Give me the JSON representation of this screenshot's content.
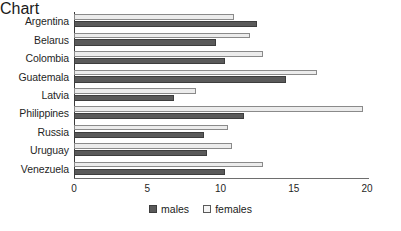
{
  "chart_data": {
    "type": "bar",
    "orientation": "horizontal",
    "title": "",
    "subtitle": "",
    "xlabel": "",
    "ylabel": "",
    "xlim": [
      0,
      20
    ],
    "xticks": [
      "0",
      "5",
      "10",
      "15",
      "20"
    ],
    "xtick_values": [
      0,
      5,
      10,
      15,
      20
    ],
    "grid": false,
    "legend_position": "bottom-center",
    "categories": [
      "Argentina",
      "Belarus",
      "Colombia",
      "Guatemala",
      "Latvia",
      "Philippines",
      "Russia",
      "Uruguay",
      "Venezuela"
    ],
    "series": [
      {
        "name": "males",
        "color": "#5a5a5a",
        "values": [
          12.5,
          9.7,
          10.3,
          14.5,
          6.8,
          11.6,
          8.9,
          9.1,
          10.3
        ]
      },
      {
        "name": "females",
        "color": "#ececec",
        "values": [
          10.9,
          12.0,
          12.9,
          16.6,
          8.3,
          19.7,
          10.5,
          10.8,
          12.9
        ]
      }
    ]
  },
  "legend": {
    "items": [
      {
        "label": "males",
        "swatch": "filled-dark-square-icon"
      },
      {
        "label": "females",
        "swatch": "outlined-light-square-icon"
      }
    ]
  }
}
